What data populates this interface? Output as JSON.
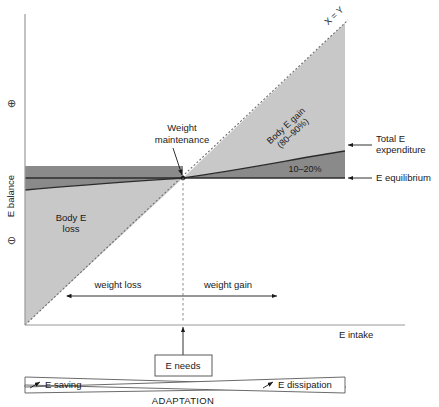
{
  "figure": {
    "type": "diagram"
  },
  "axes": {
    "x_label": "E intake",
    "y_label": "E balance",
    "y_positive_symbol": "⊕",
    "y_negative_symbol": "⊖",
    "x_axis_color": "#9a9a9a",
    "y_axis_color": "#9a9a9a"
  },
  "regions": [
    {
      "name": "body-e-gain",
      "label_line1": "Body E gain",
      "label_line2": "(80–90%)",
      "fill": "#c8c8c8"
    },
    {
      "name": "body-e-loss",
      "label_line1": "Body E",
      "label_line2": "loss",
      "fill": "#c8c8c8"
    },
    {
      "name": "expenditure-band",
      "label": "10–20%",
      "fill": "#8a8a8a"
    }
  ],
  "lines": [
    {
      "name": "identity-line",
      "label": "X = Y",
      "style": "dashed"
    },
    {
      "name": "total-e-expenditure-curve",
      "label": "Total E expenditure",
      "style": "solid"
    },
    {
      "name": "e-equilibrium-line",
      "label": "E equilibrium",
      "style": "solid"
    },
    {
      "name": "e-needs-vertical",
      "style": "dashed"
    }
  ],
  "callouts": {
    "weight_maintenance_line1": "Weight",
    "weight_maintenance_line2": "maintenance",
    "total_expenditure_line1": "Total E",
    "total_expenditure_line2": "expenditure",
    "e_equilibrium": "E equilibrium",
    "percent_band": "10–20%",
    "identity": "X = Y",
    "body_gain_line1": "Body E gain",
    "body_gain_line2": "(80–90%)",
    "body_loss_line1": "Body E",
    "body_loss_line2": "loss"
  },
  "direction_arrow": {
    "left_label": "weight loss",
    "right_label": "weight gain"
  },
  "adaptation": {
    "needs_box_label": "E needs",
    "left_wedge_label": "E saving",
    "right_wedge_label": "E dissipation",
    "caption": "ADAPTATION"
  },
  "colors": {
    "light_grey": "#c8c8c8",
    "dark_grey": "#8a8a8a",
    "line_black": "#2b2b2b",
    "axis_grey": "#9a9a9a",
    "background": "#ffffff"
  }
}
